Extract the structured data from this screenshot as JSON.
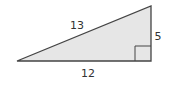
{
  "diagram": {
    "type": "right-triangle",
    "sides": {
      "hypotenuse": "13",
      "vertical_leg": "5",
      "horizontal_leg": "12"
    },
    "right_angle_marker": true,
    "colors": {
      "fill": "#e6e6e6",
      "stroke": "#444444",
      "label": "#333333"
    }
  }
}
